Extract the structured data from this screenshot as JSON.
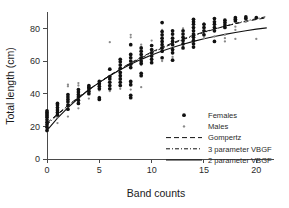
{
  "chart_data": {
    "type": "scatter",
    "title": "",
    "xlabel": "Band counts",
    "ylabel": "Total length (cm)",
    "xlim": [
      0,
      21.5
    ],
    "ylim": [
      0,
      90
    ],
    "xticks": [
      0,
      5,
      10,
      15,
      20
    ],
    "xticklabels": [
      "0",
      "5",
      "10",
      "15",
      "20"
    ],
    "yticks": [
      0,
      20,
      40,
      60,
      80
    ],
    "yticklabels": [
      "0",
      "20",
      "40",
      "60",
      "80"
    ],
    "grid": false,
    "legend_position": "lower right",
    "series": [
      {
        "name": "Females",
        "marker": "filled-circle",
        "color": "#111111",
        "points": [
          [
            0,
            17.5
          ],
          [
            0,
            19.5
          ],
          [
            0,
            21.0
          ],
          [
            0,
            22.5
          ],
          [
            0,
            24.0
          ],
          [
            0,
            25.5
          ],
          [
            0,
            26.5
          ],
          [
            0,
            27.5
          ],
          [
            0,
            28.5
          ],
          [
            0,
            29.5
          ],
          [
            1,
            27.0
          ],
          [
            1,
            28.5
          ],
          [
            1,
            30.0
          ],
          [
            1,
            31.5
          ],
          [
            1,
            33.0
          ],
          [
            1,
            34.0
          ],
          [
            2,
            30.5
          ],
          [
            2,
            33.0
          ],
          [
            2,
            35.0
          ],
          [
            2,
            36.5
          ],
          [
            2,
            38.0
          ],
          [
            2,
            39.5
          ],
          [
            3,
            34.0
          ],
          [
            3,
            36.0
          ],
          [
            3,
            38.0
          ],
          [
            3,
            39.5
          ],
          [
            3,
            41.0
          ],
          [
            3,
            42.5
          ],
          [
            4,
            40.0
          ],
          [
            4,
            41.5
          ],
          [
            4,
            43.0
          ],
          [
            4,
            44.0
          ],
          [
            4,
            45.0
          ],
          [
            5,
            36.5
          ],
          [
            5,
            37.5
          ],
          [
            5,
            43.0
          ],
          [
            5,
            44.5
          ],
          [
            5,
            46.0
          ],
          [
            5,
            47.5
          ],
          [
            6,
            43.0
          ],
          [
            6,
            45.0
          ],
          [
            6,
            47.0
          ],
          [
            6,
            49.0
          ],
          [
            6,
            50.5
          ],
          [
            6,
            55.0
          ],
          [
            7,
            45.0
          ],
          [
            7,
            47.0
          ],
          [
            7,
            49.0
          ],
          [
            7,
            51.0
          ],
          [
            7,
            53.0
          ],
          [
            7,
            55.5
          ],
          [
            7,
            57.5
          ],
          [
            7,
            59.5
          ],
          [
            7,
            61.0
          ],
          [
            8,
            37.5
          ],
          [
            8,
            39.0
          ],
          [
            8,
            45.5
          ],
          [
            8,
            47.5
          ],
          [
            8,
            56.0
          ],
          [
            8,
            58.0
          ],
          [
            8,
            60.0
          ],
          [
            8,
            62.0
          ],
          [
            8,
            64.0
          ],
          [
            8,
            70.0
          ],
          [
            9,
            51.0
          ],
          [
            9,
            52.5
          ],
          [
            9,
            58.5
          ],
          [
            9,
            60.0
          ],
          [
            9,
            62.0
          ],
          [
            9,
            64.0
          ],
          [
            9,
            66.0
          ],
          [
            9,
            68.0
          ],
          [
            10,
            59.0
          ],
          [
            10,
            61.0
          ],
          [
            10,
            63.0
          ],
          [
            10,
            65.0
          ],
          [
            10,
            67.0
          ],
          [
            10,
            69.5
          ],
          [
            11,
            62.0
          ],
          [
            11,
            66.0
          ],
          [
            11,
            68.0
          ],
          [
            11,
            70.0
          ],
          [
            11,
            72.0
          ],
          [
            11,
            74.0
          ],
          [
            11,
            76.0
          ],
          [
            11,
            78.0
          ],
          [
            11,
            83.5
          ],
          [
            12,
            60.5
          ],
          [
            12,
            65.0
          ],
          [
            12,
            67.0
          ],
          [
            12,
            70.0
          ],
          [
            12,
            72.0
          ],
          [
            12,
            74.0
          ],
          [
            12,
            76.5
          ],
          [
            12,
            78.5
          ],
          [
            13,
            68.0
          ],
          [
            13,
            70.5
          ],
          [
            13,
            72.5
          ],
          [
            13,
            74.5
          ],
          [
            13,
            76.5
          ],
          [
            13,
            78.5
          ],
          [
            14,
            68.5
          ],
          [
            14,
            70.5
          ],
          [
            14,
            72.5
          ],
          [
            14,
            74.5
          ],
          [
            14,
            76.5
          ],
          [
            14,
            78.5
          ],
          [
            14,
            80.5
          ],
          [
            14,
            82.5
          ],
          [
            14,
            84.0
          ],
          [
            14,
            85.5
          ],
          [
            15,
            76.0
          ],
          [
            15,
            78.5
          ],
          [
            15,
            80.5
          ],
          [
            15,
            82.5
          ],
          [
            16,
            72.0
          ],
          [
            16,
            78.5
          ],
          [
            16,
            80.5
          ],
          [
            16,
            82.5
          ],
          [
            16,
            84.0
          ],
          [
            16,
            86.0
          ],
          [
            17,
            80.5
          ],
          [
            17,
            82.0
          ],
          [
            17,
            83.5
          ],
          [
            17,
            85.0
          ],
          [
            18,
            84.5
          ],
          [
            18,
            85.5
          ],
          [
            18,
            86.5
          ],
          [
            19,
            86.0
          ],
          [
            19,
            87.0
          ],
          [
            20,
            86.5
          ]
        ]
      },
      {
        "name": "Males",
        "marker": "small-dot",
        "color": "#8a8a8a",
        "points": [
          [
            0,
            17.0
          ],
          [
            0,
            18.5
          ],
          [
            0,
            20.0
          ],
          [
            0,
            21.5
          ],
          [
            0,
            23.0
          ],
          [
            0,
            25.0
          ],
          [
            1,
            22.0
          ],
          [
            1,
            25.5
          ],
          [
            1,
            27.0
          ],
          [
            1,
            29.0
          ],
          [
            2,
            26.0
          ],
          [
            2,
            31.0
          ],
          [
            2,
            34.5
          ],
          [
            2,
            44.5
          ],
          [
            2,
            45.5
          ],
          [
            3,
            31.0
          ],
          [
            3,
            35.0
          ],
          [
            3,
            38.5
          ],
          [
            3,
            45.0
          ],
          [
            3,
            46.5
          ],
          [
            4,
            37.0
          ],
          [
            4,
            41.0
          ],
          [
            4,
            42.5
          ],
          [
            4,
            44.0
          ],
          [
            5,
            38.0
          ],
          [
            5,
            42.0
          ],
          [
            5,
            44.0
          ],
          [
            5,
            46.0
          ],
          [
            6,
            41.5
          ],
          [
            6,
            44.5
          ],
          [
            6,
            47.0
          ],
          [
            6,
            49.0
          ],
          [
            6,
            71.5
          ],
          [
            7,
            43.0
          ],
          [
            7,
            45.5
          ],
          [
            7,
            48.0
          ],
          [
            7,
            50.0
          ],
          [
            7,
            55.5
          ],
          [
            8,
            42.5
          ],
          [
            8,
            45.0
          ],
          [
            8,
            47.5
          ],
          [
            8,
            56.0
          ],
          [
            8,
            58.5
          ],
          [
            8,
            63.0
          ],
          [
            8,
            74.5
          ],
          [
            8,
            76.0
          ],
          [
            9,
            44.0
          ],
          [
            9,
            57.5
          ],
          [
            9,
            60.0
          ],
          [
            9,
            70.0
          ],
          [
            10,
            61.5
          ],
          [
            10,
            64.0
          ],
          [
            10,
            66.0
          ],
          [
            10,
            72.5
          ],
          [
            11,
            60.0
          ],
          [
            11,
            65.5
          ],
          [
            11,
            67.5
          ],
          [
            11,
            71.0
          ],
          [
            11,
            79.0
          ],
          [
            12,
            62.5
          ],
          [
            12,
            66.0
          ],
          [
            12,
            72.0
          ],
          [
            12,
            74.0
          ],
          [
            12,
            78.0
          ],
          [
            13,
            69.0
          ],
          [
            13,
            71.0
          ],
          [
            13,
            73.0
          ],
          [
            13,
            80.0
          ],
          [
            14,
            71.0
          ],
          [
            14,
            73.0
          ],
          [
            14,
            79.0
          ],
          [
            14,
            85.0
          ],
          [
            15,
            74.0
          ],
          [
            15,
            76.5
          ],
          [
            15,
            81.0
          ],
          [
            15,
            83.0
          ],
          [
            16,
            75.0
          ],
          [
            16,
            79.0
          ],
          [
            16,
            81.0
          ],
          [
            17,
            72.0
          ],
          [
            17,
            74.0
          ],
          [
            17,
            76.0
          ],
          [
            17,
            84.0
          ],
          [
            18,
            73.5
          ],
          [
            18,
            79.0
          ],
          [
            18,
            81.0
          ],
          [
            19,
            84.0
          ],
          [
            20,
            73.5
          ]
        ]
      }
    ],
    "fits": [
      {
        "name": "Gompertz",
        "style": "dashed",
        "color": "#111111",
        "points": [
          [
            0,
            22.0
          ],
          [
            1,
            27.5
          ],
          [
            2,
            32.8
          ],
          [
            3,
            37.8
          ],
          [
            4,
            42.5
          ],
          [
            5,
            47.0
          ],
          [
            6,
            51.2
          ],
          [
            7,
            55.2
          ],
          [
            8,
            58.9
          ],
          [
            9,
            62.3
          ],
          [
            10,
            65.5
          ],
          [
            11,
            68.4
          ],
          [
            12,
            71.1
          ],
          [
            13,
            73.5
          ],
          [
            14,
            75.8
          ],
          [
            15,
            77.8
          ],
          [
            16,
            79.6
          ],
          [
            17,
            81.3
          ],
          [
            18,
            82.8
          ],
          [
            19,
            84.2
          ],
          [
            20,
            85.4
          ],
          [
            21,
            86.5
          ]
        ]
      },
      {
        "name": "3 parameter VBGF",
        "style": "dash-dot",
        "color": "#111111",
        "points": [
          [
            0,
            21.0
          ],
          [
            1,
            27.0
          ],
          [
            2,
            32.5
          ],
          [
            3,
            37.6
          ],
          [
            4,
            42.4
          ],
          [
            5,
            46.8
          ],
          [
            6,
            51.0
          ],
          [
            7,
            54.9
          ],
          [
            8,
            58.5
          ],
          [
            9,
            61.9
          ],
          [
            10,
            65.0
          ],
          [
            11,
            67.9
          ],
          [
            12,
            70.6
          ],
          [
            13,
            73.1
          ],
          [
            14,
            75.4
          ],
          [
            15,
            77.5
          ],
          [
            16,
            79.5
          ],
          [
            17,
            81.3
          ],
          [
            18,
            83.0
          ],
          [
            19,
            84.5
          ],
          [
            20,
            85.9
          ],
          [
            21,
            87.2
          ]
        ]
      },
      {
        "name": "2 parameter VBGF",
        "style": "solid",
        "color": "#111111",
        "points": [
          [
            0,
            17.5
          ],
          [
            1,
            25.0
          ],
          [
            2,
            31.5
          ],
          [
            3,
            37.2
          ],
          [
            4,
            42.3
          ],
          [
            5,
            46.9
          ],
          [
            6,
            51.0
          ],
          [
            7,
            54.7
          ],
          [
            8,
            58.0
          ],
          [
            9,
            61.0
          ],
          [
            10,
            63.7
          ],
          [
            11,
            66.1
          ],
          [
            12,
            68.3
          ],
          [
            13,
            70.2
          ],
          [
            14,
            72.0
          ],
          [
            15,
            73.6
          ],
          [
            16,
            75.0
          ],
          [
            17,
            76.3
          ],
          [
            18,
            77.5
          ],
          [
            19,
            78.5
          ],
          [
            20,
            79.5
          ],
          [
            21,
            80.3
          ]
        ]
      }
    ],
    "legend": [
      {
        "label": "Females",
        "type": "marker",
        "marker": "filled-circle"
      },
      {
        "label": "Males",
        "type": "marker",
        "marker": "small-dot"
      },
      {
        "label": "Gompertz",
        "type": "line",
        "style": "dashed"
      },
      {
        "label": "3 parameter VBGF",
        "type": "line",
        "style": "dash-dot"
      },
      {
        "label": "2 parameter VBGF",
        "type": "line",
        "style": "solid"
      }
    ]
  }
}
